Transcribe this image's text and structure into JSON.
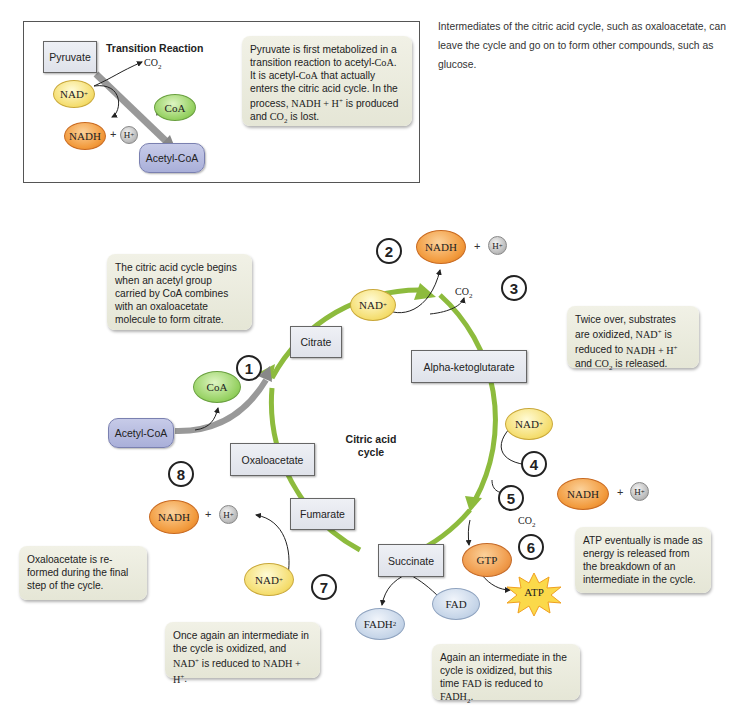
{
  "caption": "Intermediates of the citric acid cycle, such as oxaloacetate, can leave the cycle and go on to form other compounds, such as glucose.",
  "inset": {
    "title": "Transition Reaction",
    "pyruvate": "Pyruvate",
    "co2": "CO2",
    "nad": "NAD+",
    "nadh": "NADH",
    "plus": "+",
    "h": "H+",
    "coa": "CoA",
    "acetyl_coa": "Acetyl-CoA",
    "note": "Pyruvate is first metabolized in a transition reaction to acetyl-CoA. It is acetyl-CoA that actually enters the citric acid cycle. In the process, NADH + H+ is produced and CO2 is lost."
  },
  "cycle": {
    "center_label": "Citric acid cycle",
    "intermediates": [
      "Citrate",
      "Alpha-ketoglutarate",
      "Succinate",
      "Fumarate",
      "Oxaloacetate"
    ],
    "acetyl_coa": "Acetyl-CoA",
    "coa": "CoA",
    "steps": [
      "1",
      "2",
      "3",
      "4",
      "5",
      "6",
      "7",
      "8"
    ],
    "molecules": {
      "nad": "NAD+",
      "nadh": "NADH",
      "h": "H+",
      "co2": "CO2",
      "gtp": "GTP",
      "atp": "ATP",
      "fad": "FAD",
      "fadh2": "FADH2",
      "plus": "+"
    }
  },
  "notes": {
    "begin": "The citric acid cycle begins when an acetyl group carried by CoA combines with an oxaloacetate molecule to form citrate.",
    "twice": "Twice over, substrates are oxidized, NAD+ is reduced to NADH + H+ and CO2 is released.",
    "atp": "ATP eventually is made as energy is released from the breakdown of an intermediate in the cycle.",
    "fad": "Again an intermediate in the cycle is oxidized, but this time FAD is reduced to FADH2.",
    "nad_again": "Once again an intermediate in the cycle is oxidized, and NAD+ is reduced to NADH + H+.",
    "reformed": "Oxaloacetate is re-formed during the final step of the cycle."
  },
  "colors": {
    "cycle_arrow": "#8dbb3d",
    "note_bg": "#ebebdd",
    "nad": "#f4dc6a",
    "nadh": "#f29a3c",
    "coa": "#92cf5d",
    "fad": "#c3d3e7",
    "acetyl_coa": "#b4b9df"
  }
}
